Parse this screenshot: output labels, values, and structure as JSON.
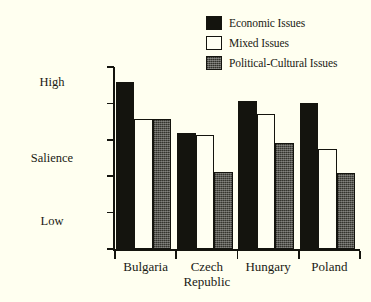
{
  "chart_data": {
    "type": "bar",
    "title": "",
    "subtitle": "",
    "xlabel": "",
    "ylabel": "Salience",
    "ylim": [
      2.5,
      5
    ],
    "yticks": [
      "2.5",
      "3",
      "3.5",
      "4",
      "4.5",
      "5"
    ],
    "ytick_values": [
      2.5,
      3,
      3.5,
      4,
      4.5,
      5
    ],
    "grid": false,
    "legend_position": "top-right",
    "categories": [
      "Bulgaria",
      "Czech\nRepublic",
      "Hungary",
      "Poland"
    ],
    "series": [
      {
        "name": "Economic Issues",
        "color": "#14140e",
        "style": "solid-black",
        "values": [
          4.79,
          4.1,
          4.54,
          4.5
        ]
      },
      {
        "name": "Mixed Issues",
        "color": "#fffff2",
        "style": "outlined-white",
        "values": [
          4.29,
          4.06,
          4.35,
          3.88
        ]
      },
      {
        "name": "Political-Cultural Issues",
        "color": "#56564f",
        "style": "stippled-gray",
        "values": [
          4.28,
          3.56,
          3.96,
          3.55
        ]
      }
    ],
    "axis_descriptors": {
      "high": "High",
      "middle": "Salience",
      "low": "Low"
    }
  },
  "legend": {
    "items": [
      {
        "label": "Economic Issues",
        "swatch": "black-square-icon"
      },
      {
        "label": "Mixed Issues",
        "swatch": "white-square-icon"
      },
      {
        "label": "Political-Cultural Issues",
        "swatch": "gray-square-icon"
      }
    ]
  },
  "colors": {
    "background": "#fffff0",
    "ink": "#14140e",
    "series_black": "#14140e",
    "series_white": "#fffff2",
    "series_gray": "#56564f"
  }
}
